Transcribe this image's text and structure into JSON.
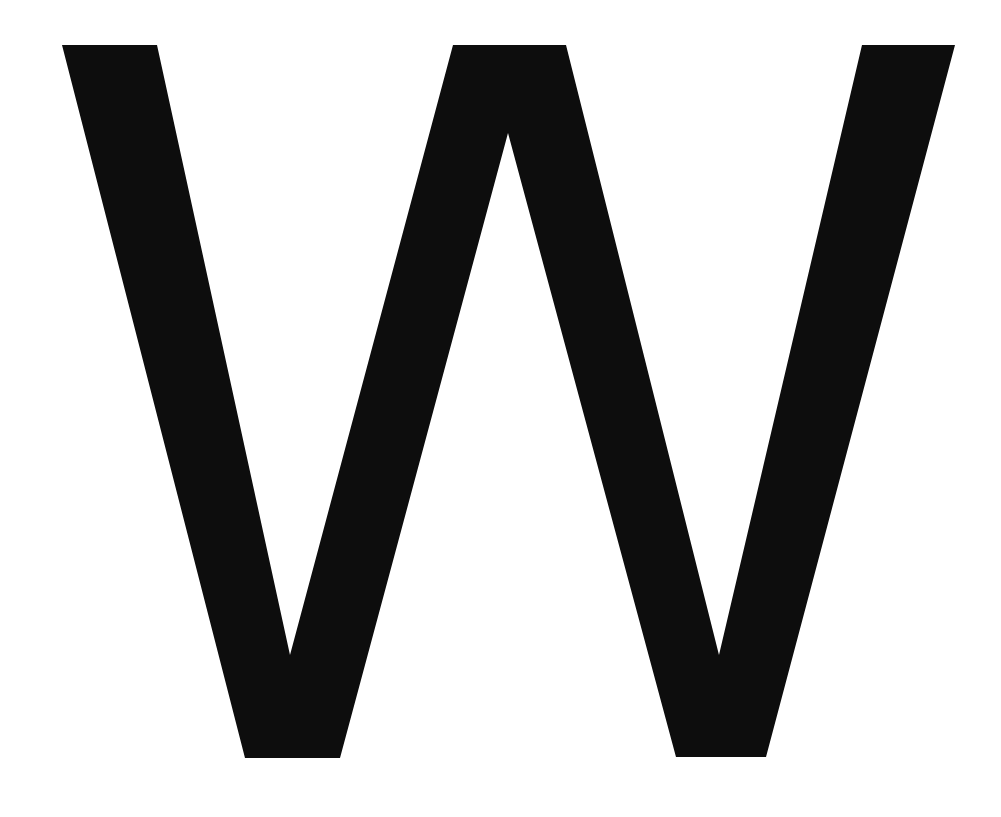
{
  "glyph": {
    "character": "W",
    "fill_color": "#0d0d0d",
    "background_color": "#ffffff",
    "outline_points": [
      [
        62,
        45
      ],
      [
        157,
        45
      ],
      [
        290,
        655
      ],
      [
        453,
        45
      ],
      [
        566,
        45
      ],
      [
        719,
        655
      ],
      [
        862,
        45
      ],
      [
        955,
        45
      ],
      [
        766,
        757
      ],
      [
        676,
        757
      ],
      [
        508,
        133
      ],
      [
        340,
        758
      ],
      [
        245,
        758
      ]
    ]
  }
}
